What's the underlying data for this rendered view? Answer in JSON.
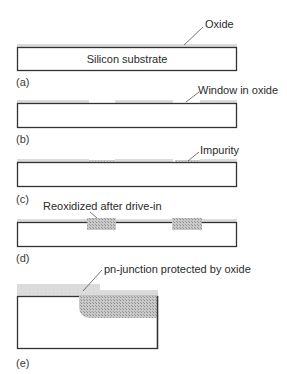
{
  "colors": {
    "outline": "#333333",
    "oxide": "#d6d6d6",
    "impurity": "#b9b9b9",
    "leader": "#555555",
    "text": "#2a2a2a"
  },
  "panels": [
    {
      "id": "a",
      "caption": "(a)",
      "box": {
        "x": 17,
        "y": 47,
        "w": 220,
        "h": 24
      },
      "inner_text": "Silicon substrate",
      "oxide": [
        {
          "x": 17,
          "y": 44,
          "w": 220,
          "h": 3
        }
      ],
      "impurity": [],
      "annotation": {
        "text": "Oxide",
        "tx": 205,
        "ty": 18,
        "lx1": 184,
        "ly1": 45,
        "lx2": 203,
        "ly2": 27
      },
      "caption_pos": {
        "x": 16,
        "y": 76
      }
    },
    {
      "id": "b",
      "caption": "(b)",
      "box": {
        "x": 17,
        "y": 103,
        "w": 220,
        "h": 25
      },
      "oxide": [
        {
          "x": 17,
          "y": 100,
          "w": 72,
          "h": 3
        },
        {
          "x": 115,
          "y": 100,
          "w": 58,
          "h": 3
        },
        {
          "x": 200,
          "y": 100,
          "w": 37,
          "h": 3
        }
      ],
      "impurity": [],
      "annotation": {
        "text": "Window in oxide",
        "tx": 198,
        "ty": 84,
        "lx1": 186,
        "ly1": 102,
        "lx2": 199,
        "ly2": 92
      },
      "caption_pos": {
        "x": 16,
        "y": 133
      }
    },
    {
      "id": "c",
      "caption": "(c)",
      "box": {
        "x": 17,
        "y": 162,
        "w": 220,
        "h": 25
      },
      "oxide": [
        {
          "x": 17,
          "y": 159,
          "w": 72,
          "h": 3
        },
        {
          "x": 115,
          "y": 159,
          "w": 58,
          "h": 3
        },
        {
          "x": 200,
          "y": 159,
          "w": 37,
          "h": 3
        }
      ],
      "impurity": [
        {
          "x": 89,
          "y": 160,
          "w": 26,
          "h": 2
        },
        {
          "x": 175,
          "y": 160,
          "w": 25,
          "h": 2
        }
      ],
      "annotation": {
        "text": "Impurity",
        "tx": 200,
        "ty": 144,
        "lx1": 188,
        "ly1": 161,
        "lx2": 199,
        "ly2": 152
      },
      "caption_pos": {
        "x": 16,
        "y": 193
      }
    },
    {
      "id": "d",
      "caption": "(d)",
      "box": {
        "x": 17,
        "y": 222,
        "w": 220,
        "h": 25
      },
      "oxide": [
        {
          "x": 17,
          "y": 219,
          "w": 220,
          "h": 3
        }
      ],
      "impurity": [
        {
          "x": 87,
          "y": 218,
          "w": 29,
          "h": 12
        },
        {
          "x": 172,
          "y": 218,
          "w": 30,
          "h": 12
        }
      ],
      "annotation": {
        "text": "Reoxidized after drive-in",
        "tx": 43,
        "ty": 200,
        "lx1": 97,
        "ly1": 218,
        "lx2": 90,
        "ly2": 212
      },
      "caption_pos": {
        "x": 16,
        "y": 252
      }
    },
    {
      "id": "e",
      "caption": "(e)",
      "box": {
        "x": 17,
        "y": 296,
        "w": 141,
        "h": 53
      },
      "oxide": [
        {
          "x": 17,
          "y": 284,
          "w": 83,
          "h": 12
        },
        {
          "x": 100,
          "y": 290,
          "w": 58,
          "h": 6
        }
      ],
      "impurity": [],
      "junction": {
        "x": 79,
        "y": 296,
        "w": 79,
        "h": 22,
        "r": 12
      },
      "annotation": {
        "text": "pn-junction protected by oxide",
        "tx": 104,
        "ty": 263,
        "lx1": 83,
        "ly1": 291,
        "lx2": 102,
        "ly2": 270
      },
      "caption_pos": {
        "x": 16,
        "y": 357
      }
    }
  ]
}
